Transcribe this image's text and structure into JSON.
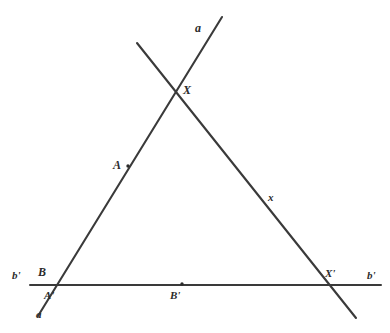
{
  "figure": {
    "width": 390,
    "height": 333,
    "background_color": "#ffffff",
    "stroke_color": "#3a3a3a",
    "label_color": "#2b2b2b"
  },
  "labels": {
    "a_top": "a",
    "a_bottom": "a",
    "x_right": "x",
    "X_intersection": "X",
    "X_prime": "X'",
    "A_point": "A",
    "A_prime": "A'",
    "B_point": "B",
    "B_prime": "B'",
    "b_prime_left": "b'",
    "b_prime_right": "b'"
  },
  "geometry": {
    "line_a": {
      "name": "a",
      "from": {
        "x": 38,
        "y": 316
      },
      "to": {
        "x": 222,
        "y": 17
      }
    },
    "line_x": {
      "name": "x",
      "from": {
        "x": 137,
        "y": 43
      },
      "to": {
        "x": 356,
        "y": 318
      }
    },
    "line_b_prime": {
      "name": "b'",
      "from": {
        "x": 30,
        "y": 285
      },
      "to": {
        "x": 381,
        "y": 285
      }
    },
    "points": {
      "X": {
        "x": 178,
        "y": 91
      },
      "X_prime": {
        "x": 330,
        "y": 285
      },
      "A": {
        "x": 128,
        "y": 166
      },
      "A_prime": {
        "x": 52,
        "y": 285
      },
      "B": {
        "x": 52,
        "y": 285
      },
      "B_prime": {
        "x": 182,
        "y": 284
      }
    },
    "markers": [
      {
        "name": "A",
        "x": 128,
        "y": 166
      },
      {
        "name": "B'",
        "x": 182,
        "y": 284
      }
    ]
  }
}
